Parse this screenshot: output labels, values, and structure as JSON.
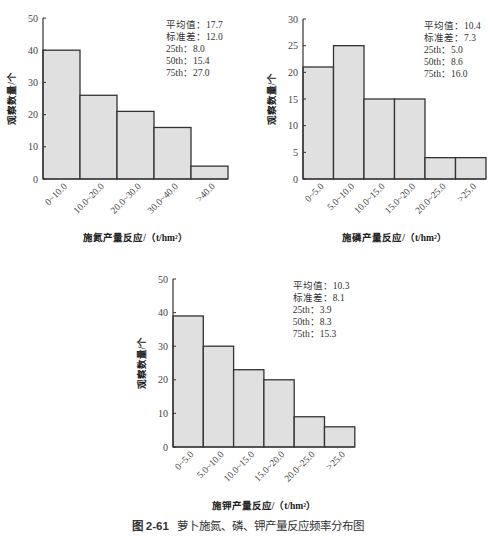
{
  "figure": {
    "caption_number": "图 2-61",
    "caption_text": "萝卜施氮、磷、钾产量反应频率分布图"
  },
  "style": {
    "bar_fill": "#e0e0e0",
    "bar_stroke": "#333333",
    "axis": "#333333"
  },
  "chart_data": [
    {
      "type": "bar",
      "title": "",
      "xlabel": "施氮产量反应/（t/hm²）",
      "ylabel": "观察数量/个",
      "categories": [
        "0~10.0",
        "10.0~20.0",
        "20.0~30.0",
        "30.0~40.0",
        ">40.0"
      ],
      "values": [
        40,
        26,
        21,
        16,
        4
      ],
      "ylim": [
        0,
        50
      ],
      "yticks": [
        0,
        10,
        20,
        30,
        40,
        50
      ],
      "stats": [
        "平均值：17.7",
        "标准差：12.0",
        "25th：8.0",
        "50th：15.4",
        "75th：27.0"
      ],
      "layout": {
        "x0": 43,
        "y0": 179,
        "ytop": 18,
        "barw": 37
      }
    },
    {
      "type": "bar",
      "title": "",
      "xlabel": "施磷产量反应/（t/hm²）",
      "ylabel": "观察数量/个",
      "categories": [
        "0~5.0",
        "5.0~10.0",
        "10.0~15.0",
        "15.0~20.0",
        "20.0~25.0",
        ">25.0"
      ],
      "values": [
        21,
        25,
        15,
        15,
        4,
        4
      ],
      "ylim": [
        0,
        30
      ],
      "yticks": [
        0,
        5,
        10,
        15,
        20,
        25,
        30
      ],
      "stats": [
        "平均值：10.4",
        "标准差：7.3",
        "25th：5.0",
        "50th：8.6",
        "75th：16.0"
      ],
      "layout": {
        "x0": 303,
        "y0": 179,
        "ytop": 19,
        "barw": 30.5
      }
    },
    {
      "type": "bar",
      "title": "",
      "xlabel": "施钾产量反应/（t/hm²）",
      "ylabel": "观察数量/个",
      "categories": [
        "0~5.0",
        "5.0~10.0",
        "10.0~15.0",
        "15.0~20.0",
        "20.0~25.0",
        ">25.0"
      ],
      "values": [
        39,
        30,
        23,
        20,
        9,
        6
      ],
      "ylim": [
        0,
        50
      ],
      "yticks": [
        0,
        10,
        20,
        30,
        40,
        50
      ],
      "stats": [
        "平均值：10.3",
        "标准差：8.1",
        "25th：3.9",
        "50th：8.3",
        "75th：15.3"
      ],
      "layout": {
        "x0": 173,
        "y0": 447,
        "ytop": 279,
        "barw": 30.3
      }
    }
  ]
}
